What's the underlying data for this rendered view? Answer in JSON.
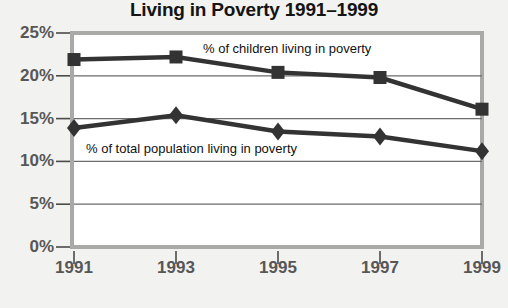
{
  "chart_data": {
    "type": "line",
    "title": "Living in Poverty 1991–1999",
    "xlabel": "",
    "ylabel": "",
    "categories": [
      "1991",
      "1993",
      "1995",
      "1997",
      "1999"
    ],
    "x": [
      1991,
      1993,
      1995,
      1997,
      1999
    ],
    "ylim": [
      0,
      25
    ],
    "ytick_labels": [
      "0%",
      "5%",
      "10%",
      "15%",
      "20%",
      "25%"
    ],
    "ytick_values": [
      0,
      5,
      10,
      15,
      20,
      25
    ],
    "grid": "horizontal",
    "legend_position": "inline-annotations",
    "series": [
      {
        "name": "% of children living in poverty",
        "marker": "square",
        "color": "#333333",
        "values": [
          21.9,
          22.2,
          20.4,
          19.8,
          16.1
        ]
      },
      {
        "name": "% of total population living in poverty",
        "marker": "diamond",
        "color": "#333333",
        "values": [
          13.9,
          15.4,
          13.5,
          12.9,
          11.2
        ]
      }
    ],
    "annotations": [
      {
        "text": "% of children living in poverty",
        "x": 1993.7,
        "y": 23.2
      },
      {
        "text": "% of total population living in poverty",
        "x": 1991.4,
        "y": 12.4
      }
    ]
  },
  "colors": {
    "page_background": "#f2f2f0",
    "plot_background": "#ffffff",
    "frame": "#a9a9a7",
    "gridline": "#6b6b6b",
    "axis_text": "#575757",
    "title_text": "#141414",
    "series": "#333333"
  }
}
